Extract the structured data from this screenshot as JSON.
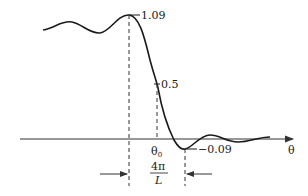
{
  "diagram": {
    "type": "step-response-with-ripple",
    "axis": {
      "label": "θ"
    },
    "annotations": {
      "peak_value": "1.09",
      "half_value": "0.5",
      "min_value": "−0.09",
      "center_label": "θ",
      "center_subscript": "0",
      "width_numerator": "4π",
      "width_denominator": "L"
    }
  },
  "colors": {
    "curve": "#1a1a1a",
    "axis": "#333333",
    "background": "#ffffff"
  }
}
